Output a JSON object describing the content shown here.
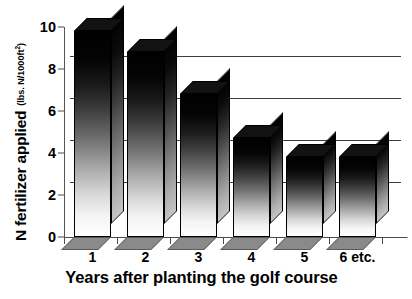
{
  "chart_data": {
    "type": "bar",
    "title": "",
    "xlabel": "Years after planting the golf course",
    "ylabel": "N fertilizer applied",
    "ylabel_units": "(lbs. N/1000ft²)",
    "categories": [
      "1",
      "2",
      "3",
      "4",
      "5",
      "6 etc."
    ],
    "values": [
      9.8,
      8.8,
      6.8,
      4.7,
      3.8,
      3.8
    ],
    "ylim": [
      0,
      10
    ],
    "ytick_labels": [
      "0",
      "2",
      "4",
      "6",
      "8",
      "10"
    ],
    "ytick_values": [
      0,
      2,
      4,
      6,
      8,
      10
    ],
    "gridlines": [
      2,
      4,
      6,
      8
    ],
    "grid": true,
    "legend": "none",
    "style_3d": true,
    "bar_fill": "#000000-to-#ffffff vertical gradient",
    "axis_color": "#4a4a4a",
    "background": "#ffffff"
  },
  "axis": {
    "y_title_main": "N fertilizer applied",
    "y_title_units_pre": "(lbs. N/1000ft",
    "y_title_units_sup": "2",
    "y_title_units_post": ")",
    "x_title": "Years after planting the golf course"
  }
}
